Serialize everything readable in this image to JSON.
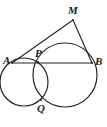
{
  "figure": {
    "background_color": "#ffffff",
    "stroke_color": "#262626",
    "width": 107,
    "height": 127,
    "labels": {
      "A": "A",
      "B": "B",
      "M": "M",
      "P": "P",
      "Q": "Q"
    },
    "label_positions": {
      "A": {
        "x": 3,
        "y": 55
      },
      "B": {
        "x": 95,
        "y": 56
      },
      "M": {
        "x": 68,
        "y": 5
      },
      "P": {
        "x": 35,
        "y": 48
      },
      "Q": {
        "x": 37,
        "y": 103
      }
    },
    "points": {
      "A": {
        "x": 12,
        "y": 63
      },
      "B": {
        "x": 92,
        "y": 63
      },
      "M": {
        "x": 73,
        "y": 20
      },
      "P": {
        "x": 38,
        "y": 62
      },
      "Q": {
        "x": 41,
        "y": 100
      }
    },
    "circles": [
      {
        "name": "left-circle",
        "cx": 24,
        "cy": 82,
        "r": 24
      },
      {
        "name": "right-circle",
        "cx": 65,
        "cy": 75,
        "r": 32
      }
    ],
    "segments": [
      {
        "name": "segment-AB",
        "from": "A",
        "to": "B"
      },
      {
        "name": "segment-AM",
        "from": "A",
        "to": "M"
      },
      {
        "name": "segment-MB",
        "from": "M",
        "to": "B"
      }
    ]
  }
}
